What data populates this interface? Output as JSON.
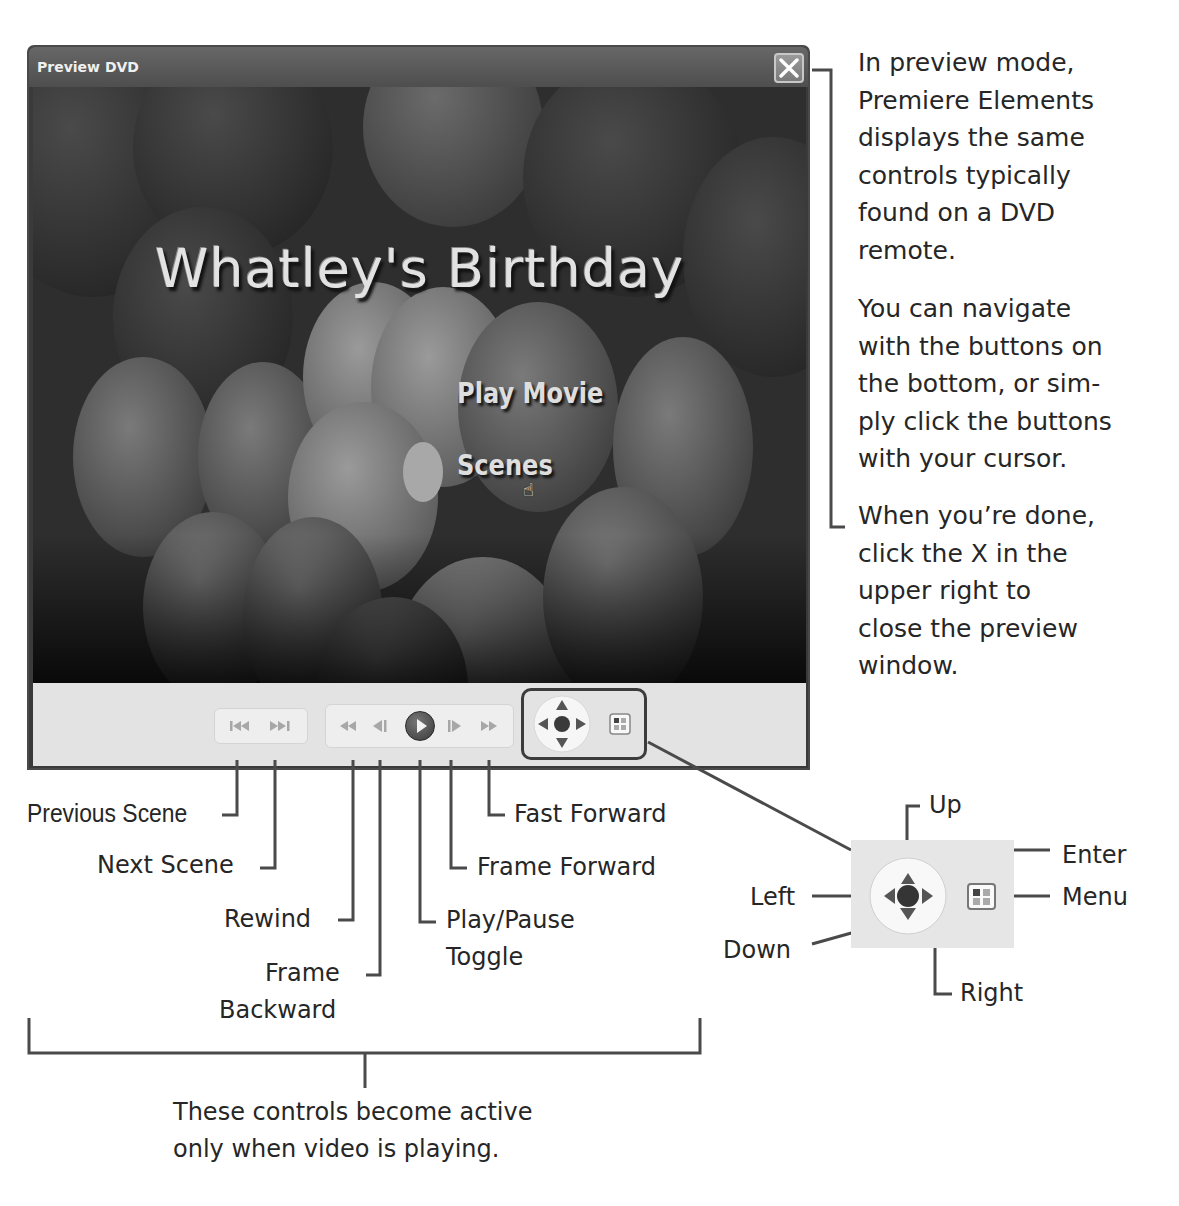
{
  "window": {
    "title": "Preview DVD",
    "close_label": "X",
    "dvd_menu": {
      "title": "Whatley's Birthday",
      "buttons": [
        "Play Movie",
        "Scenes"
      ],
      "cursor": "hand-pointer over Scenes"
    },
    "controls": {
      "scene_group": [
        {
          "name": "previous-scene",
          "glyph": "|◀◀"
        },
        {
          "name": "next-scene",
          "glyph": "▶▶|"
        }
      ],
      "transport_group": [
        {
          "name": "rewind",
          "glyph": "◀◀"
        },
        {
          "name": "frame-backward",
          "glyph": "◀|"
        },
        {
          "name": "play-pause",
          "glyph": "▶"
        },
        {
          "name": "frame-forward",
          "glyph": "|▶"
        },
        {
          "name": "fast-forward",
          "glyph": "▶▶"
        }
      ],
      "nav_group": [
        "up",
        "down",
        "left",
        "right",
        "enter",
        "menu"
      ]
    }
  },
  "callouts": {
    "right_column": {
      "para1": "In preview mode, Premiere Elements displays the same controls typically found on a DVD remote.",
      "para1_lines": [
        "In preview mode,",
        "Premiere Elements",
        "displays the same",
        "controls typically",
        "found on a DVD",
        "remote."
      ],
      "para2_lines": [
        "You can navigate",
        "with the buttons on",
        "the bottom, or sim-",
        "ply click the buttons",
        "with your cursor."
      ],
      "para3_lines": [
        "When you’re done,",
        "click the X in the",
        "upper right to",
        "close the preview",
        "window."
      ]
    },
    "control_labels": {
      "previous_scene": "Previous Scene",
      "next_scene": "Next Scene",
      "rewind": "Rewind",
      "frame_backward_1": "Frame",
      "frame_backward_2": "Backward",
      "play_pause_1": "Play/Pause",
      "play_pause_2": "Toggle",
      "frame_forward": "Frame Forward",
      "fast_forward": "Fast Forward"
    },
    "nav_labels": {
      "up": "Up",
      "enter": "Enter",
      "left": "Left",
      "menu": "Menu",
      "down": "Down",
      "right": "Right"
    },
    "bracket_note_lines": [
      "These controls become active",
      "only when video is playing."
    ]
  }
}
